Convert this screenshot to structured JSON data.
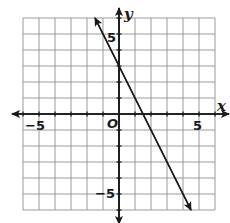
{
  "chart_data": {
    "type": "line",
    "title": "",
    "xlabel": "x",
    "ylabel": "y",
    "xlim": [
      -6,
      6
    ],
    "ylim": [
      -6,
      6
    ],
    "grid": true,
    "origin_label": "O",
    "x_tick_labels": [
      {
        "value": -5,
        "label": "−5"
      },
      {
        "value": 5,
        "label": "5"
      }
    ],
    "y_tick_labels": [
      {
        "value": 5,
        "label": "5"
      },
      {
        "value": -5,
        "label": "−5"
      }
    ],
    "series": [
      {
        "name": "line",
        "equation": "y = -2x + 3",
        "slope": -2,
        "y_intercept": 3,
        "x": [
          -1.5,
          0,
          1.5,
          4.5
        ],
        "y": [
          6,
          3,
          0,
          -6
        ],
        "arrows": "both"
      }
    ]
  },
  "labels": {
    "x_axis": "x",
    "y_axis": "y",
    "origin": "O",
    "x_neg5": "−5",
    "x_pos5": "5",
    "y_pos5": "5",
    "y_neg5": "−5"
  }
}
